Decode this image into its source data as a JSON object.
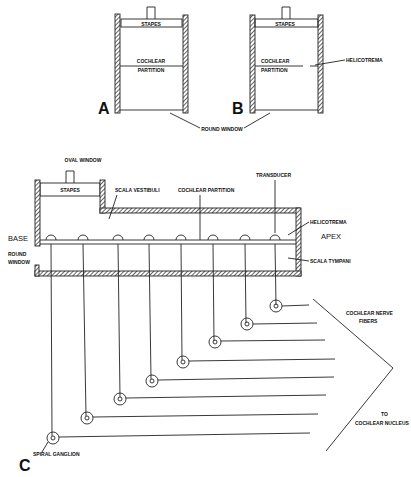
{
  "panel_a": {
    "letter": "A",
    "stapes": "STAPES",
    "partition_1": "COCHLEAR",
    "partition_2": "PARTITION"
  },
  "panel_b": {
    "letter": "B",
    "stapes": "STAPES",
    "partition_1": "COCHLEAR",
    "partition_2": "PARTITION",
    "helicotrema": "HELICOTREMA"
  },
  "shared": {
    "round_window": "ROUND   WINDOW"
  },
  "panel_c": {
    "letter": "C",
    "oval_window": "OVAL   WINDOW",
    "stapes": "STAPES",
    "scala_vestibuli": "SCALA   VESTIBULI",
    "cochlear_partition": "COCHLEAR   PARTITION",
    "transducer": "TRANSDUCER",
    "helicotrema": "HELICOTREMA",
    "base": "BASE",
    "apex": "APEX",
    "round_window_1": "ROUND",
    "round_window_2": "WINDOW",
    "scala_tympani": "SCALA   TYMPANI",
    "nerve_fibers_1": "COCHLEAR   NERVE",
    "nerve_fibers_2": "FIBERS",
    "nucleus_1": "TO",
    "nucleus_2": "COCHLEAR  NUCLEUS",
    "spiral_ganglion": "SPIRAL   GANGLION"
  }
}
